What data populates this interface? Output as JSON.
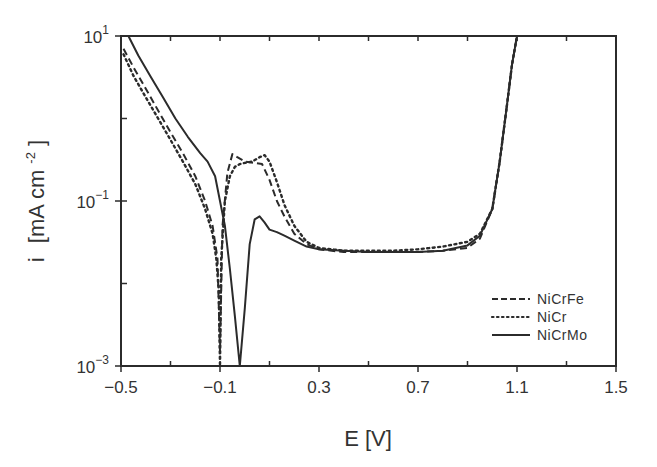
{
  "chart_data": {
    "type": "line",
    "title": "",
    "xlabel": "E [V]",
    "ylabel": "i [mA cm⁻²]",
    "xlim": [
      -0.5,
      1.5
    ],
    "ylim": [
      0.001,
      10
    ],
    "yscale": "log",
    "grid": false,
    "legend_position": "lower right",
    "x_ticks": [
      -0.5,
      -0.1,
      0.3,
      0.7,
      1.1,
      1.5
    ],
    "x_tick_labels": [
      "-0.5",
      "-0.1",
      "0.3",
      "0.7",
      "1.1",
      "1.5"
    ],
    "x_minor_ticks": [
      -0.3,
      0.1,
      0.5,
      0.9,
      1.3
    ],
    "y_ticks": [
      0.001,
      0.1,
      10
    ],
    "y_tick_labels": [
      {
        "base": "10",
        "exp": "-3"
      },
      {
        "base": "10",
        "exp": "-1"
      },
      {
        "base": "10",
        "exp": "1"
      }
    ],
    "y_minor_ticks": [
      0.01,
      1
    ],
    "series": [
      {
        "name": "NiCrFe",
        "style": "dashed",
        "x": [
          -0.49,
          -0.45,
          -0.4,
          -0.35,
          -0.3,
          -0.25,
          -0.2,
          -0.16,
          -0.13,
          -0.11,
          -0.1,
          -0.09,
          -0.07,
          -0.05,
          -0.03,
          0.0,
          0.04,
          0.07,
          0.1,
          0.13,
          0.16,
          0.2,
          0.25,
          0.3,
          0.4,
          0.5,
          0.6,
          0.7,
          0.8,
          0.9,
          0.95,
          1.0,
          1.03,
          1.06,
          1.08,
          1.1
        ],
        "y": [
          7.0,
          4.2,
          2.3,
          1.25,
          0.68,
          0.38,
          0.2,
          0.1,
          0.05,
          0.02,
          0.0015,
          0.05,
          0.22,
          0.37,
          0.34,
          0.3,
          0.29,
          0.28,
          0.18,
          0.1,
          0.065,
          0.04,
          0.03,
          0.026,
          0.024,
          0.024,
          0.024,
          0.024,
          0.025,
          0.027,
          0.035,
          0.08,
          0.3,
          1.5,
          4.5,
          10
        ]
      },
      {
        "name": "NiCr",
        "style": "dotted",
        "x": [
          -0.49,
          -0.45,
          -0.4,
          -0.35,
          -0.3,
          -0.25,
          -0.2,
          -0.16,
          -0.13,
          -0.115,
          -0.105,
          -0.1,
          -0.095,
          -0.08,
          -0.06,
          -0.04,
          -0.02,
          0.0,
          0.03,
          0.06,
          0.08,
          0.1,
          0.13,
          0.16,
          0.2,
          0.25,
          0.3,
          0.4,
          0.5,
          0.6,
          0.7,
          0.8,
          0.9,
          0.95,
          1.0,
          1.03,
          1.06,
          1.08,
          1.1
        ],
        "y": [
          6.0,
          3.3,
          1.8,
          1.0,
          0.55,
          0.3,
          0.16,
          0.08,
          0.04,
          0.02,
          0.008,
          0.001,
          0.02,
          0.1,
          0.2,
          0.26,
          0.28,
          0.29,
          0.3,
          0.34,
          0.36,
          0.3,
          0.17,
          0.09,
          0.05,
          0.032,
          0.027,
          0.025,
          0.025,
          0.025,
          0.026,
          0.028,
          0.032,
          0.04,
          0.08,
          0.3,
          1.5,
          4.5,
          10
        ]
      },
      {
        "name": "NiCrMo",
        "style": "solid",
        "x": [
          -0.47,
          -0.43,
          -0.38,
          -0.33,
          -0.28,
          -0.23,
          -0.18,
          -0.15,
          -0.12,
          -0.1,
          -0.08,
          -0.06,
          -0.04,
          -0.02,
          0.0,
          0.02,
          0.04,
          0.06,
          0.08,
          0.1,
          0.13,
          0.16,
          0.2,
          0.25,
          0.3,
          0.4,
          0.5,
          0.6,
          0.7,
          0.8,
          0.9,
          0.95,
          1.0,
          1.03,
          1.06,
          1.08,
          1.1
        ],
        "y": [
          10,
          5.8,
          3.2,
          1.8,
          1.0,
          0.6,
          0.38,
          0.3,
          0.2,
          0.1,
          0.05,
          0.015,
          0.004,
          0.001,
          0.005,
          0.03,
          0.06,
          0.065,
          0.055,
          0.045,
          0.042,
          0.038,
          0.033,
          0.028,
          0.026,
          0.025,
          0.024,
          0.024,
          0.024,
          0.025,
          0.029,
          0.038,
          0.08,
          0.3,
          1.5,
          4.5,
          10
        ]
      }
    ]
  },
  "legend": {
    "items": [
      {
        "label": "NiCrFe",
        "style": "dashed"
      },
      {
        "label": "NiCr",
        "style": "dotted"
      },
      {
        "label": "NiCrMo",
        "style": "solid"
      }
    ]
  },
  "axes": {
    "x_title": "E [V]",
    "y_title_main": "i",
    "y_title_unit": "[mA cm",
    "y_title_exp": "-2",
    "y_title_close": "]"
  }
}
